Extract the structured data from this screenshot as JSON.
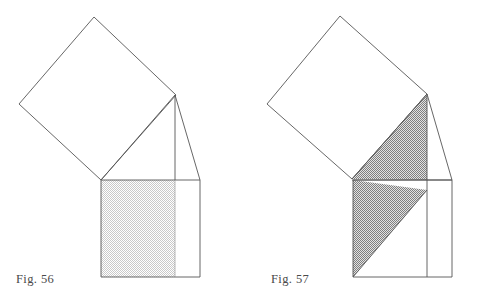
{
  "page": {
    "background_color": "#ffffff",
    "width": 477,
    "height": 307,
    "stroke_color": "#555555",
    "stroke_width": 0.8
  },
  "figures": [
    {
      "id": "fig56",
      "caption": "Fig. 56",
      "caption_x": 16,
      "caption_y": 272,
      "shade_color": "#d9d9d9",
      "shade_label": "light-checker",
      "geometry": {
        "tilted_square": [
          [
            94,
            17
          ],
          [
            176,
            95
          ],
          [
            101,
            180
          ],
          [
            19,
            104
          ]
        ],
        "base_rectangle": [
          [
            101,
            180
          ],
          [
            200,
            180
          ],
          [
            200,
            277
          ],
          [
            101,
            277
          ]
        ],
        "shaded_region": [
          [
            101,
            180
          ],
          [
            175,
            180
          ],
          [
            175,
            277
          ],
          [
            101,
            277
          ]
        ],
        "apex": [
          175,
          95
        ],
        "vertical_line": [
          [
            175,
            95
          ],
          [
            175,
            180
          ]
        ],
        "hypotenuse_line": [
          [
            175,
            95
          ],
          [
            200,
            180
          ]
        ],
        "left_slope_line": [
          [
            101,
            180
          ],
          [
            175,
            95
          ]
        ]
      }
    },
    {
      "id": "fig57",
      "caption": "Fig. 57",
      "caption_x": 271,
      "caption_y": 272,
      "shade_color": "#aeaeae",
      "shade_label": "dark-checker",
      "geometry": {
        "tilted_square": [
          [
            340,
            16
          ],
          [
            427,
            94
          ],
          [
            352,
            179
          ],
          [
            267,
            104
          ]
        ],
        "base_rectangle": [
          [
            353,
            180
          ],
          [
            452,
            180
          ],
          [
            452,
            277
          ],
          [
            353,
            277
          ]
        ],
        "shaded_upper_triangle": [
          [
            352,
            179
          ],
          [
            427,
            94
          ],
          [
            427,
            180
          ]
        ],
        "shaded_lower_triangle": [
          [
            353,
            180
          ],
          [
            353,
            277
          ],
          [
            427,
            190
          ]
        ],
        "apex": [
          427,
          94
        ],
        "vertical_line": [
          [
            427,
            94
          ],
          [
            427,
            277
          ]
        ],
        "hypotenuse_line": [
          [
            427,
            94
          ],
          [
            452,
            180
          ]
        ],
        "left_slope_line": [
          [
            352,
            179
          ],
          [
            427,
            94
          ]
        ]
      }
    }
  ]
}
